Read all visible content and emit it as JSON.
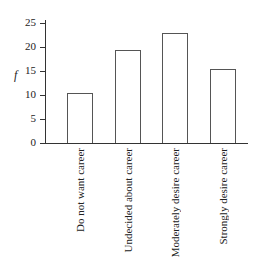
{
  "chart_data": {
    "type": "bar",
    "title": "",
    "xlabel": "",
    "ylabel": "f",
    "categories": [
      "Do not want career",
      "Undecided about career",
      "Moderately desire career",
      "Strongly desire career"
    ],
    "values": [
      10.4,
      19.4,
      22.9,
      15.4
    ],
    "ylim": [
      0,
      25
    ],
    "yticks": [
      0,
      5,
      10,
      15,
      20,
      25
    ],
    "grid": false,
    "legend": null
  },
  "ui": {
    "ylabel": "f",
    "ytick_labels": [
      "0",
      "5",
      "10",
      "15",
      "20",
      "25"
    ]
  }
}
